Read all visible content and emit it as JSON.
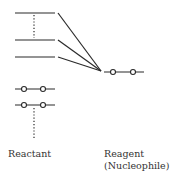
{
  "diagram": {
    "type": "molecular-orbital-interaction",
    "reactant": {
      "label": "Reactant",
      "empty_orbitals": 3,
      "filled_orbitals": 2
    },
    "reagent": {
      "label_line1": "Reagent",
      "label_line2": "(Nucleophile)",
      "filled_orbitals": 1
    },
    "colors": {
      "line": "#2a2a2a",
      "text": "#333333"
    }
  }
}
